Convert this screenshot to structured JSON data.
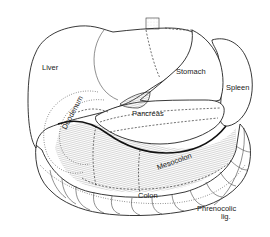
{
  "diagram": {
    "type": "anatomical line drawing",
    "labels": {
      "liver": "Liver",
      "stomach": "Stomach",
      "spleen": "Spleen",
      "duodenum": "Duodenum",
      "pancreas": "Pancreas",
      "mesocolon": "Mesocolon",
      "colon": "Colon",
      "phrenocolic_line1": "Phrenocolic",
      "phrenocolic_line2": "lig."
    },
    "colors": {
      "line": "#222222",
      "background": "#ffffff",
      "hatching": "#888888"
    }
  }
}
